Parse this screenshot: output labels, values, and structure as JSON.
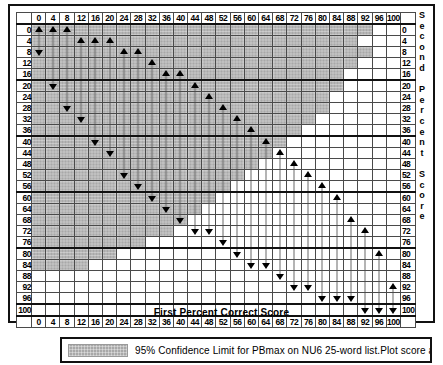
{
  "chart_data": {
    "type": "heatmap",
    "title": "",
    "xlabel": "First Percent Correct Score",
    "ylabel_left": "PTA dB HL",
    "ylabel_right": "Second Percent Score",
    "xlim": [
      0,
      100
    ],
    "ylim": [
      0,
      100
    ],
    "grid": true,
    "categories": [
      0,
      4,
      8,
      12,
      16,
      20,
      24,
      28,
      32,
      36,
      40,
      44,
      48,
      52,
      56,
      60,
      64,
      68,
      72,
      76,
      80,
      84,
      88,
      92,
      96,
      100
    ],
    "row_categories": [
      0,
      4,
      8,
      12,
      16,
      20,
      24,
      28,
      32,
      36,
      40,
      44,
      48,
      52,
      56,
      60,
      64,
      68,
      72,
      76,
      80,
      84,
      88,
      92,
      96,
      100
    ],
    "legend": [
      {
        "swatch": "shaded",
        "color": "#a8a8a8",
        "label": "95% Confidence Limit for PBmax on NU6 25-word list.Plot score according"
      }
    ],
    "band_description": "Shaded cells mark the 95% confidence interval band; for each first-score column the band spans from a lower to an upper second-score row.",
    "band_rows_shaded_col_range": [
      {
        "row": 0,
        "from_col": 0,
        "to_col": 92
      },
      {
        "row": 4,
        "from_col": 0,
        "to_col": 88
      },
      {
        "row": 8,
        "from_col": 0,
        "to_col": 92
      },
      {
        "row": 12,
        "from_col": 0,
        "to_col": 88
      },
      {
        "row": 16,
        "from_col": 0,
        "to_col": 84
      },
      {
        "row": 20,
        "from_col": 0,
        "to_col": 84
      },
      {
        "row": 24,
        "from_col": 0,
        "to_col": 80
      },
      {
        "row": 28,
        "from_col": 0,
        "to_col": 80
      },
      {
        "row": 32,
        "from_col": 0,
        "to_col": 76
      },
      {
        "row": 36,
        "from_col": 0,
        "to_col": 72
      },
      {
        "row": 40,
        "from_col": 0,
        "to_col": 68
      },
      {
        "row": 44,
        "from_col": 0,
        "to_col": 64
      },
      {
        "row": 48,
        "from_col": 0,
        "to_col": 60
      },
      {
        "row": 52,
        "from_col": 0,
        "to_col": 56
      },
      {
        "row": 56,
        "from_col": 0,
        "to_col": 52
      },
      {
        "row": 60,
        "from_col": 0,
        "to_col": 48
      },
      {
        "row": 64,
        "from_col": 0,
        "to_col": 44
      },
      {
        "row": 68,
        "from_col": 0,
        "to_col": 40
      },
      {
        "row": 72,
        "from_col": 0,
        "to_col": 36
      },
      {
        "row": 76,
        "from_col": 0,
        "to_col": 28
      },
      {
        "row": 80,
        "from_col": 0,
        "to_col": 20
      },
      {
        "row": 84,
        "from_col": 0,
        "to_col": 12
      }
    ],
    "markers_up": [
      {
        "col": 0,
        "row": 0
      },
      {
        "col": 4,
        "row": 0
      },
      {
        "col": 8,
        "row": 0
      },
      {
        "col": 12,
        "row": 4
      },
      {
        "col": 16,
        "row": 4
      },
      {
        "col": 20,
        "row": 4
      },
      {
        "col": 24,
        "row": 8
      },
      {
        "col": 28,
        "row": 8
      },
      {
        "col": 32,
        "row": 12
      },
      {
        "col": 36,
        "row": 16
      },
      {
        "col": 40,
        "row": 16
      },
      {
        "col": 44,
        "row": 20
      },
      {
        "col": 48,
        "row": 24
      },
      {
        "col": 52,
        "row": 28
      },
      {
        "col": 56,
        "row": 32
      },
      {
        "col": 60,
        "row": 36
      },
      {
        "col": 64,
        "row": 40
      },
      {
        "col": 68,
        "row": 44
      },
      {
        "col": 72,
        "row": 48
      },
      {
        "col": 76,
        "row": 52
      },
      {
        "col": 80,
        "row": 56
      },
      {
        "col": 84,
        "row": 60
      },
      {
        "col": 88,
        "row": 68
      },
      {
        "col": 92,
        "row": 72
      },
      {
        "col": 96,
        "row": 80
      },
      {
        "col": 100,
        "row": 92
      }
    ],
    "markers_down": [
      {
        "col": 0,
        "row": 8
      },
      {
        "col": 4,
        "row": 20
      },
      {
        "col": 8,
        "row": 28
      },
      {
        "col": 12,
        "row": 32
      },
      {
        "col": 16,
        "row": 40
      },
      {
        "col": 20,
        "row": 44
      },
      {
        "col": 24,
        "row": 52
      },
      {
        "col": 28,
        "row": 56
      },
      {
        "col": 32,
        "row": 60
      },
      {
        "col": 36,
        "row": 64
      },
      {
        "col": 40,
        "row": 68
      },
      {
        "col": 44,
        "row": 72
      },
      {
        "col": 48,
        "row": 72
      },
      {
        "col": 52,
        "row": 76
      },
      {
        "col": 56,
        "row": 80
      },
      {
        "col": 60,
        "row": 84
      },
      {
        "col": 64,
        "row": 84
      },
      {
        "col": 68,
        "row": 88
      },
      {
        "col": 72,
        "row": 92
      },
      {
        "col": 76,
        "row": 92
      },
      {
        "col": 80,
        "row": 96
      },
      {
        "col": 84,
        "row": 96
      },
      {
        "col": 88,
        "row": 96
      },
      {
        "col": 92,
        "row": 100
      },
      {
        "col": 96,
        "row": 100
      },
      {
        "col": 100,
        "row": 100
      }
    ]
  },
  "axes": {
    "x_title": "First Percent Correct Score",
    "y_title_left_chars": [
      "P",
      "T",
      "A",
      "",
      "d",
      "B",
      "H",
      "L"
    ],
    "y_title_right_chars": [
      "S",
      "e",
      "c",
      "o",
      "n",
      "d",
      "",
      "P",
      "e",
      "r",
      "c",
      "e",
      "n",
      "t",
      "",
      "S",
      "c",
      "o",
      "r",
      "e"
    ],
    "tick_labels": [
      "0",
      "4",
      "8",
      "12",
      "16",
      "20",
      "24",
      "28",
      "32",
      "36",
      "40",
      "44",
      "48",
      "52",
      "56",
      "60",
      "64",
      "68",
      "72",
      "76",
      "80",
      "84",
      "88",
      "92",
      "96",
      "100"
    ]
  },
  "legend": {
    "text": "95% Confidence Limit for PBmax on NU6 25-word list.Plot score according",
    "swatch_color": "#a8a8a8"
  }
}
